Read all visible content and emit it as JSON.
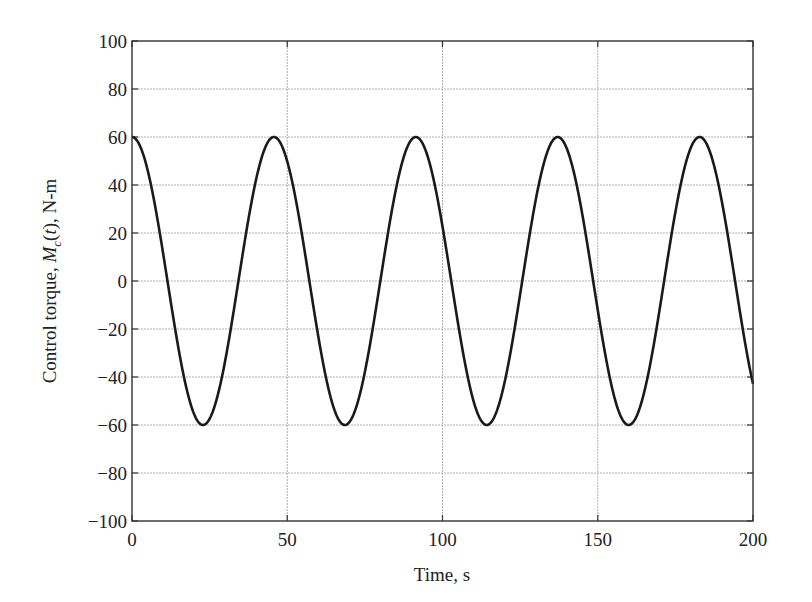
{
  "chart_data": {
    "type": "line",
    "title": "",
    "xlabel": "Time, s",
    "ylabel_parts": [
      "Control torque, ",
      "M",
      "c",
      "(",
      "t",
      "), N-m"
    ],
    "ylabel": "Control torque, M_c(t), N-m",
    "xlim": [
      0,
      200
    ],
    "ylim": [
      -100,
      100
    ],
    "xticks": [
      0,
      50,
      100,
      150,
      200
    ],
    "yticks": [
      100,
      80,
      60,
      40,
      20,
      0,
      -20,
      -40,
      -60,
      -80,
      -100
    ],
    "ytick_labels": [
      "100",
      "80",
      "60",
      "40",
      "20",
      "0",
      "−20",
      "−40",
      "−60",
      "−80",
      "−100"
    ],
    "grid": true,
    "legend": null,
    "series": [
      {
        "name": "Mc(t)",
        "color": "#1a1a1a",
        "x": [
          0,
          5,
          10,
          15,
          20,
          25,
          30,
          35,
          40,
          45,
          50,
          55,
          60,
          65,
          70,
          75,
          80,
          85,
          90,
          95,
          100,
          105,
          110,
          115,
          120,
          125,
          130,
          135,
          140,
          145,
          150,
          155,
          160,
          165,
          170,
          175,
          180,
          185,
          190,
          195,
          200
        ],
        "values": [
          60,
          46.6,
          11.5,
          -28.8,
          -57.2,
          -57.3,
          -29.4,
          6.4,
          42.3,
          59.8,
          51.5,
          21.5,
          -19.3,
          -53.2,
          -59.6,
          -38.6,
          -1.5,
          35.6,
          58.3,
          55.4,
          30.4,
          -9.0,
          -46.3,
          -59.7,
          -46.9,
          -11.9,
          26.9,
          54.7,
          58.3,
          38.2,
          2.1,
          -37.5,
          -59.0,
          -53.4,
          -23.2,
          17.5,
          50.3,
          59.5,
          43.3,
          7.9,
          -43.0
        ],
        "model": {
          "amplitude": 60,
          "period_s": 45.7
        }
      }
    ]
  },
  "colors": {
    "axis": "#333333",
    "grid": "#b0b0b0",
    "line": "#1a1a1a",
    "background": "#ffffff"
  }
}
